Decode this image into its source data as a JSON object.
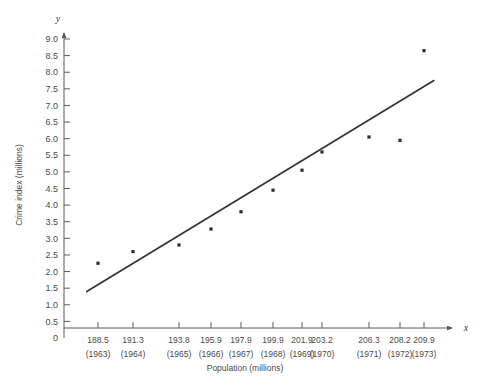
{
  "chart_data": {
    "type": "scatter",
    "title": "",
    "xlabel": "Population (millions)",
    "ylabel": "Crime index (millions)",
    "x_axis_symbol": "x",
    "y_axis_symbol": "y",
    "xlim": [
      186.8,
      211.0
    ],
    "ylim": [
      0,
      9.3
    ],
    "grid": false,
    "legend": false,
    "y_ticks": [
      0,
      0.5,
      1.0,
      1.5,
      2.0,
      2.5,
      3.0,
      3.5,
      4.0,
      4.5,
      5.0,
      5.5,
      6.0,
      6.5,
      7.0,
      7.5,
      8.0,
      8.5,
      9.0
    ],
    "y_tick_labels": [
      "0",
      "0.5",
      "1.0",
      "1.5",
      "2.0",
      "2.5",
      "3.0",
      "3.5",
      "4.0",
      "4.5",
      "5.0",
      "5.5",
      "6.0",
      "6.5",
      "7.0",
      "7.5",
      "8.0",
      "8.5",
      "9.0"
    ],
    "x_tick_labels": [
      "188.5",
      "191.3",
      "193.8",
      "195.9",
      "197.9",
      "199.9",
      "201.9",
      "203.2",
      "206.3",
      "208.2",
      "209.9"
    ],
    "x_tick_sublabels": [
      "(1963)",
      "(1964)",
      "(1965)",
      "(1966)",
      "(1967)",
      "(1968)",
      "(1969)",
      "(1970)",
      "(1971)",
      "(1972)",
      "(1973)"
    ],
    "x": [
      188.5,
      191.3,
      193.8,
      195.9,
      197.9,
      199.9,
      201.9,
      203.2,
      206.3,
      208.2,
      209.9
    ],
    "y": [
      2.25,
      2.6,
      2.8,
      3.28,
      3.8,
      4.45,
      5.05,
      5.6,
      6.05,
      5.95,
      8.65
    ],
    "points": [
      {
        "x": 188.5,
        "y": 2.25,
        "year": "1963"
      },
      {
        "x": 191.3,
        "y": 2.6,
        "year": "1964"
      },
      {
        "x": 193.8,
        "y": 2.8,
        "year": "1965"
      },
      {
        "x": 195.9,
        "y": 3.28,
        "year": "1966"
      },
      {
        "x": 197.9,
        "y": 3.8,
        "year": "1967"
      },
      {
        "x": 199.9,
        "y": 4.45,
        "year": "1968"
      },
      {
        "x": 201.9,
        "y": 5.05,
        "year": "1969"
      },
      {
        "x": 203.2,
        "y": 5.6,
        "year": "1970"
      },
      {
        "x": 206.3,
        "y": 6.05,
        "year": "1971"
      },
      {
        "x": 208.2,
        "y": 5.95,
        "year": "1972"
      },
      {
        "x": 209.9,
        "y": 8.65,
        "year": "1973"
      }
    ],
    "trend_line": {
      "x_start": 187.6,
      "y_start": 1.4,
      "x_end": 210.6,
      "y_end": 7.75
    }
  }
}
